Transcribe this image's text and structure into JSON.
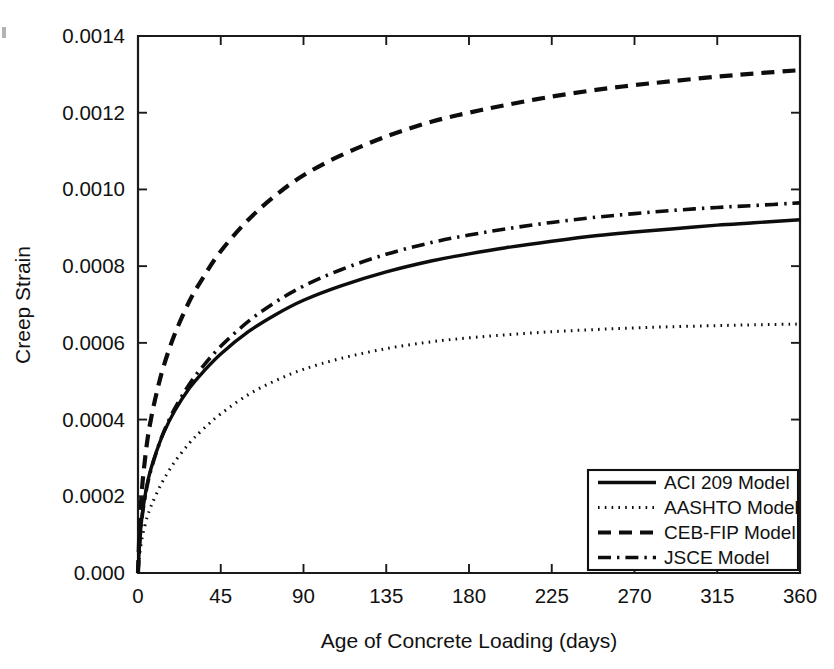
{
  "figure": {
    "background": "#ffffff",
    "line_color": "#0d0d0d",
    "axis_color": "#1a1a1a"
  },
  "chart_data": {
    "type": "line",
    "title": "",
    "xlabel": "Age of Concrete Loading (days)",
    "ylabel": "Creep Strain",
    "xlim": [
      0,
      360
    ],
    "ylim": [
      0.0,
      0.0014
    ],
    "grid": false,
    "legend_position": "lower-right",
    "xticks": [
      0,
      45,
      90,
      135,
      180,
      225,
      270,
      315,
      360
    ],
    "xticklabels": [
      "0",
      "45",
      "90",
      "135",
      "180",
      "225",
      "270",
      "315",
      "360"
    ],
    "yticks": [
      0.0,
      0.0002,
      0.0004,
      0.0006,
      0.0008,
      0.001,
      0.0012,
      0.0014
    ],
    "yticklabels": [
      "0.000",
      "0.0002",
      "0.0004",
      "0.0006",
      "0.0008",
      "0.0010",
      "0.0012",
      "0.0014"
    ],
    "x": [
      0,
      1,
      2,
      3,
      5,
      7,
      10,
      14,
      20,
      28,
      35,
      45,
      60,
      75,
      90,
      110,
      135,
      160,
      180,
      200,
      225,
      250,
      270,
      290,
      315,
      335,
      360
    ],
    "series": [
      {
        "name": "ACI 209 Model",
        "style": "solid",
        "values": [
          0.0,
          8.8e-05,
          0.00014,
          0.000177,
          0.000232,
          0.000271,
          0.000316,
          0.000366,
          0.000423,
          0.000482,
          0.000522,
          0.000571,
          0.000629,
          0.000674,
          0.000711,
          0.000748,
          0.000785,
          0.000814,
          0.000832,
          0.000848,
          0.000865,
          0.00088,
          0.000889,
          0.000897,
          0.000907,
          0.000913,
          0.000921
        ]
      },
      {
        "name": "AASHTO Model",
        "style": "dotted",
        "values": [
          0.0,
          5.2e-05,
          8.5e-05,
          0.000109,
          0.000146,
          0.000173,
          0.000206,
          0.000244,
          0.00029,
          0.000339,
          0.000373,
          0.000415,
          0.000465,
          0.000502,
          0.000531,
          0.000559,
          0.000585,
          0.000603,
          0.000613,
          0.000621,
          0.000629,
          0.000635,
          0.000639,
          0.000642,
          0.000645,
          0.000647,
          0.000649
        ]
      },
      {
        "name": "CEB-FIP Model",
        "style": "dashed",
        "values": [
          0.0,
          0.000131,
          0.000207,
          0.000262,
          0.000343,
          0.0004,
          0.000467,
          0.00054,
          0.000623,
          0.000709,
          0.000767,
          0.000839,
          0.000921,
          0.000985,
          0.001037,
          0.001088,
          0.001138,
          0.001177,
          0.0012,
          0.00122,
          0.001242,
          0.00126,
          0.001272,
          0.001282,
          0.001294,
          0.001302,
          0.001311
        ]
      },
      {
        "name": "JSCE Model",
        "style": "dashdot",
        "values": [
          0.0,
          8.5e-05,
          0.000136,
          0.000173,
          0.000228,
          0.000268,
          0.000315,
          0.000368,
          0.000429,
          0.000493,
          0.000537,
          0.000591,
          0.000656,
          0.000707,
          0.000748,
          0.00079,
          0.000831,
          0.000862,
          0.000881,
          0.000897,
          0.000914,
          0.000928,
          0.000937,
          0.000945,
          0.000953,
          0.000958,
          0.000965
        ]
      }
    ],
    "legend": [
      {
        "label": "ACI 209 Model",
        "style": "solid"
      },
      {
        "label": "AASHTO Model",
        "style": "dotted"
      },
      {
        "label": "CEB-FIP Model",
        "style": "dashed"
      },
      {
        "label": "JSCE Model",
        "style": "dashdot"
      }
    ]
  }
}
